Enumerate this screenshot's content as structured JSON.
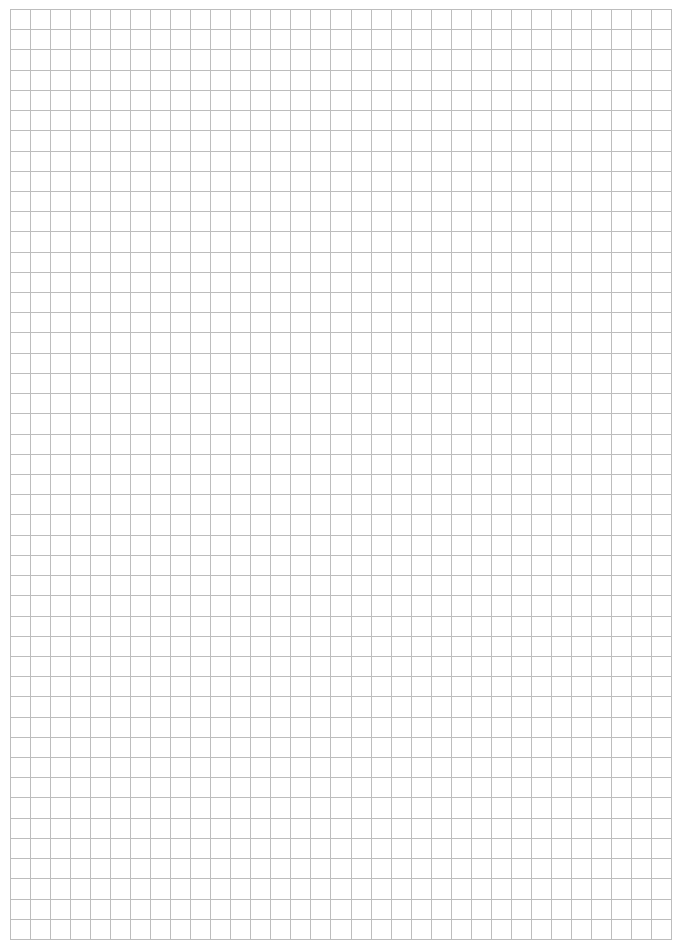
{
  "page": {
    "type": "graph-paper",
    "background_color": "#ffffff"
  },
  "grid": {
    "columns": 33,
    "rows": 46,
    "line_color": "#bdbdbd",
    "line_width": 1,
    "left": 10,
    "top": 9,
    "width": 661,
    "height": 930
  }
}
